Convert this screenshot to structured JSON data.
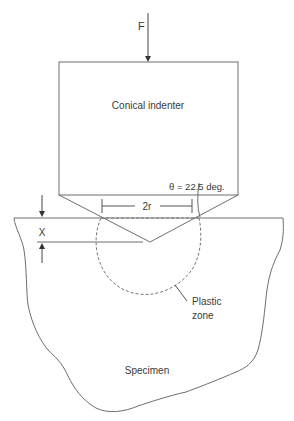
{
  "diagram": {
    "type": "conical-indentation-schematic",
    "labels": {
      "force": "F",
      "indenter": "Conical indenter",
      "angle": "θ = 22.5 deg.",
      "contact_width": "2r",
      "depth": "X",
      "plastic_zone_line1": "Plastic",
      "plastic_zone_line2": "zone",
      "specimen": "Specimen"
    },
    "colors": {
      "line": "#6e6e6e",
      "text": "#3a3a3a",
      "background": "#ffffff"
    }
  }
}
